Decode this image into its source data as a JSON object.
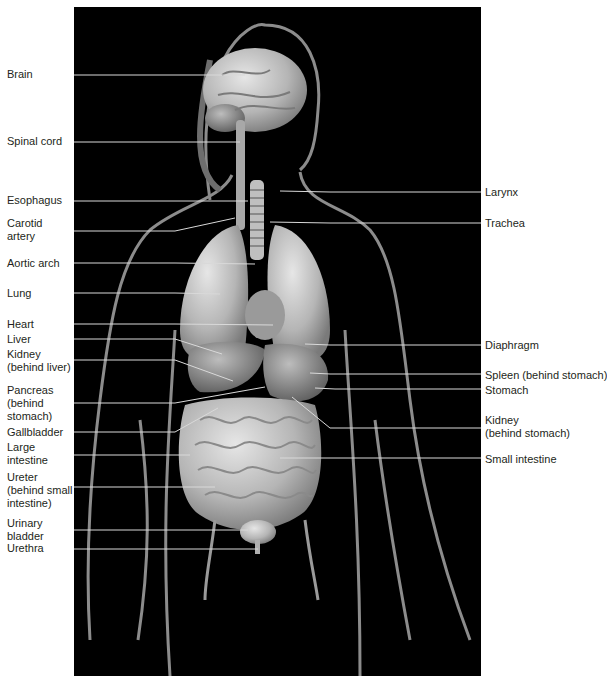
{
  "figure": {
    "background": "#000000",
    "line_color": "#d9d9d9",
    "label_color": "#231f20",
    "left_labels": [
      {
        "lines": [
          "Brain"
        ],
        "top": 68,
        "line_y": 75,
        "end_x": 245,
        "end_y": 75
      },
      {
        "lines": [
          "Spinal cord"
        ],
        "top": 135,
        "line_y": 142,
        "end_x": 240,
        "end_y": 142
      },
      {
        "lines": [
          "Esophagus"
        ],
        "top": 194,
        "line_y": 201,
        "end_x": 248,
        "end_y": 201
      },
      {
        "lines": [
          "Carotid",
          "artery"
        ],
        "top": 217,
        "line_y": 231,
        "end_x": 235,
        "end_y": 218
      },
      {
        "lines": [
          "Aortic arch"
        ],
        "top": 257,
        "line_y": 263,
        "end_x": 255,
        "end_y": 264
      },
      {
        "lines": [
          "Lung"
        ],
        "top": 287,
        "line_y": 293,
        "end_x": 220,
        "end_y": 294
      },
      {
        "lines": [
          "Heart"
        ],
        "top": 318,
        "line_y": 324,
        "end_x": 273,
        "end_y": 325
      },
      {
        "lines": [
          "Liver"
        ],
        "top": 333,
        "line_y": 339,
        "end_x": 222,
        "end_y": 354
      },
      {
        "lines": [
          "Kidney",
          "(behind liver)"
        ],
        "top": 348,
        "line_y": 360,
        "end_x": 233,
        "end_y": 381
      },
      {
        "lines": [
          "Pancreas",
          "(behind",
          "stomach)"
        ],
        "top": 384,
        "line_y": 403,
        "end_x": 265,
        "end_y": 387
      },
      {
        "lines": [
          "Gallbladder"
        ],
        "top": 426,
        "line_y": 432,
        "end_x": 218,
        "end_y": 408
      },
      {
        "lines": [
          "Large",
          "intestine"
        ],
        "top": 441,
        "line_y": 455,
        "end_x": 190,
        "end_y": 455
      },
      {
        "lines": [
          "Ureter",
          "(behind small",
          "intestine)"
        ],
        "top": 471,
        "line_y": 487,
        "end_x": 215,
        "end_y": 487
      },
      {
        "lines": [
          "Urinary",
          "bladder"
        ],
        "top": 517,
        "line_y": 530,
        "end_x": 248,
        "end_y": 530
      },
      {
        "lines": [
          "Urethra"
        ],
        "top": 542,
        "line_y": 549,
        "end_x": 258,
        "end_y": 549
      }
    ],
    "right_labels": [
      {
        "lines": [
          "Larynx"
        ],
        "top": 186,
        "line_y": 192,
        "end_x": 280,
        "end_y": 191
      },
      {
        "lines": [
          "Trachea"
        ],
        "top": 217,
        "line_y": 223,
        "end_x": 270,
        "end_y": 222
      },
      {
        "lines": [
          "Diaphragm"
        ],
        "top": 339,
        "line_y": 345,
        "end_x": 305,
        "end_y": 344
      },
      {
        "lines": [
          "Spleen (behind stomach)"
        ],
        "top": 369,
        "line_y": 374,
        "end_x": 310,
        "end_y": 373
      },
      {
        "lines": [
          "Stomach"
        ],
        "top": 384,
        "line_y": 389,
        "end_x": 315,
        "end_y": 388
      },
      {
        "lines": [
          "Kidney",
          "(behind stomach)"
        ],
        "top": 414,
        "line_y": 428,
        "end_x": 292,
        "end_y": 397
      },
      {
        "lines": [
          "Small intestine"
        ],
        "top": 453,
        "line_y": 458,
        "end_x": 280,
        "end_y": 458
      }
    ]
  }
}
